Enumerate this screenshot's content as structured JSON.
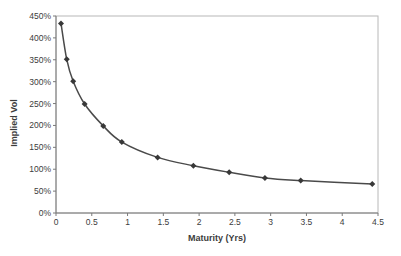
{
  "chart_data": {
    "type": "line",
    "title": "",
    "xlabel": "Maturity (Yrs)",
    "ylabel": "Implied Vol",
    "x": [
      0.07,
      0.15,
      0.24,
      0.4,
      0.66,
      0.92,
      1.42,
      1.92,
      2.42,
      2.92,
      3.42,
      4.42
    ],
    "series": [
      {
        "name": "Implied Vol",
        "y_pct": [
          433,
          351,
          301,
          249,
          199,
          162,
          127,
          108,
          93,
          80,
          74,
          66
        ]
      }
    ],
    "xlim": [
      0,
      4.5
    ],
    "ylim": [
      0,
      450
    ],
    "x_tick_values": [
      0,
      0.5,
      1,
      1.5,
      2,
      2.5,
      3,
      3.5,
      4,
      4.5
    ],
    "x_tick_labels": [
      "0",
      "0.5",
      "1",
      "1.5",
      "2",
      "2.5",
      "3",
      "3.5",
      "4",
      "4.5"
    ],
    "y_tick_values": [
      0,
      50,
      100,
      150,
      200,
      250,
      300,
      350,
      400,
      450
    ],
    "y_tick_labels": [
      "0%",
      "50%",
      "100%",
      "150%",
      "200%",
      "250%",
      "300%",
      "350%",
      "400%",
      "450%"
    ],
    "grid": false,
    "legend": "none",
    "marker": "diamond",
    "line_smooth": true,
    "colors": {
      "line": "#4a4a4a",
      "marker": "#383838",
      "axis": "#7a7a7a",
      "plot_border": "#b8b8b8",
      "text": "#3c3c3c",
      "background": "#ffffff"
    }
  }
}
